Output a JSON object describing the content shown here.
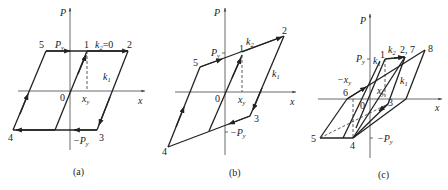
{
  "figure": {
    "type": "hysteresis-loop-diagrams",
    "panels": [
      {
        "id": "a",
        "caption": "(a)",
        "axis_labels": {
          "y": "P",
          "x": "x"
        },
        "labels": {
          "origin": "0",
          "py": "P",
          "py_sub": "y",
          "neg_py": "−P",
          "neg_py_sub": "y",
          "xy": "x",
          "xy_sub": "y",
          "k1": "k",
          "k1_sub": "1",
          "k2": "k",
          "k2_sub": "2",
          "k2_value": "=0"
        },
        "points": {
          "p1": "1",
          "p2": "2",
          "p3": "3",
          "p4": "4",
          "p5": "5"
        }
      },
      {
        "id": "b",
        "caption": "(b)",
        "axis_labels": {
          "y": "P",
          "x": "x"
        },
        "labels": {
          "origin": "0",
          "py": "P",
          "py_sub": "y",
          "neg_py": "−P",
          "neg_py_sub": "y",
          "xy": "x",
          "xy_sub": "y",
          "k1": "k",
          "k1_sub": "1",
          "k2": "k",
          "k2_sub": "2"
        },
        "points": {
          "p1": "1",
          "p2": "2",
          "p3": "3",
          "p4": "4",
          "p5": "5"
        }
      },
      {
        "id": "c",
        "caption": "(c)",
        "axis_labels": {
          "y": "P",
          "x": "x"
        },
        "labels": {
          "origin": "0",
          "py": "P",
          "py_sub": "y",
          "neg_py": "−P",
          "neg_py_sub": "y",
          "xy": "x",
          "xy_sub": "y",
          "neg_xy": "−x",
          "neg_xy_sub": "y",
          "k1": "k",
          "k1_sub": "1",
          "k1b": "k",
          "k1b_sub": "1",
          "k2": "k",
          "k2_sub": "2"
        },
        "points": {
          "p1": "1",
          "p27": "2, 7",
          "p3": "3",
          "p4": "4",
          "p5": "5",
          "p6": "6",
          "p8": "8"
        }
      }
    ]
  }
}
